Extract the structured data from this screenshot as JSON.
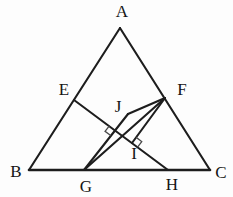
{
  "figure": {
    "type": "geometry-diagram",
    "canvas": {
      "width": 233,
      "height": 197,
      "background": "#fdfdfd"
    },
    "style": {
      "line_color": "#1d1d1d",
      "line_width": 2.1,
      "base_line_width": 2.6,
      "mark_color": "#4a4a4a",
      "mark_width": 1.3,
      "label_color": "#141414",
      "label_font_size": 17
    },
    "points": {
      "A": {
        "x": 120,
        "y": 28,
        "label": {
          "text": "A",
          "x": 122,
          "y": 17
        }
      },
      "B": {
        "x": 29,
        "y": 170,
        "label": {
          "text": "B",
          "x": 16,
          "y": 177
        }
      },
      "C": {
        "x": 210,
        "y": 170,
        "label": {
          "text": "C",
          "x": 221,
          "y": 178
        }
      },
      "E": {
        "x": 74,
        "y": 100,
        "label": {
          "text": "E",
          "x": 64,
          "y": 95
        }
      },
      "F": {
        "x": 165,
        "y": 98,
        "label": {
          "text": "F",
          "x": 182,
          "y": 95
        }
      },
      "G": {
        "x": 84,
        "y": 170,
        "label": {
          "text": "G",
          "x": 86,
          "y": 192
        }
      },
      "H": {
        "x": 168,
        "y": 170,
        "label": {
          "text": "H",
          "x": 172,
          "y": 190
        }
      },
      "J": {
        "x": 128,
        "y": 114,
        "label": {
          "text": "J",
          "x": 118,
          "y": 112
        }
      },
      "I": {
        "x": 132,
        "y": 143,
        "label": {
          "text": "I",
          "x": 134,
          "y": 159
        }
      }
    },
    "segments": [
      {
        "from": "A",
        "to": "B",
        "name": "side-AB",
        "role": "triangle-side"
      },
      {
        "from": "A",
        "to": "C",
        "name": "side-AC",
        "role": "triangle-side"
      },
      {
        "from": "B",
        "to": "C",
        "name": "side-BC",
        "role": "triangle-base"
      },
      {
        "from": "E",
        "to": "H",
        "name": "segment-EH",
        "role": "cevian"
      },
      {
        "from": "G",
        "to": "F",
        "name": "segment-GF",
        "role": "cevian"
      },
      {
        "from": "G",
        "to": "J",
        "name": "segment-GJ",
        "role": "cevian"
      },
      {
        "from": "J",
        "to": "F",
        "name": "segment-JF",
        "role": "cevian"
      },
      {
        "from": "F",
        "to": "I",
        "name": "segment-FI",
        "role": "perpendicular"
      }
    ],
    "right_angle_marks": [
      {
        "name": "right-angle-mark-J",
        "vertex": {
          "x": 115,
          "y": 130
        },
        "toward": [
          "E",
          "G"
        ],
        "size": 7
      },
      {
        "name": "right-angle-mark-I",
        "vertex": {
          "x": 132,
          "y": 143
        },
        "toward": [
          "F",
          "H"
        ],
        "size": 7
      }
    ]
  }
}
